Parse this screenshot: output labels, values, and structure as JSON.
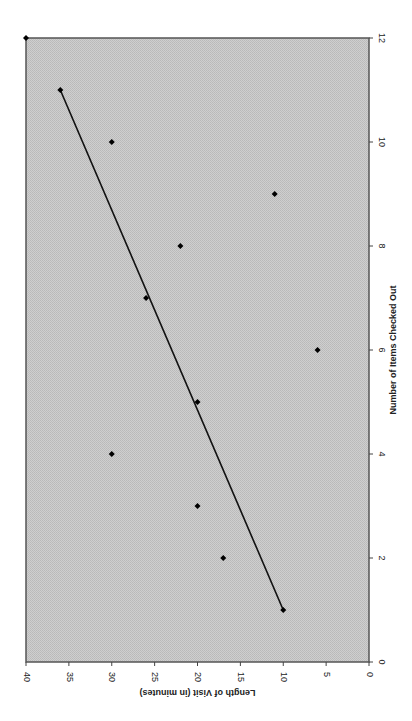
{
  "colors": {
    "plot_background": "#c8c8c8",
    "plot_border": "#555555",
    "marker": "#000000",
    "trendline": "#111111",
    "page_background": "#ffffff"
  },
  "layout": {
    "rotation_deg": -90,
    "plot_left_px": 26,
    "plot_right_px": 369,
    "plot_top_px": 38,
    "plot_bottom_px": 662
  },
  "chart_data": {
    "type": "scatter",
    "title": "",
    "xlabel": "Number of Items Checked Out",
    "ylabel": "Length of Visit (in minutes)",
    "xlim": [
      0,
      12
    ],
    "ylim": [
      0,
      40
    ],
    "x_ticks": [
      "0",
      "2",
      "4",
      "6",
      "8",
      "10",
      "12"
    ],
    "y_ticks": [
      "0",
      "5",
      "10",
      "15",
      "20",
      "25",
      "30",
      "35",
      "40"
    ],
    "grid": false,
    "legend": null,
    "series": [
      {
        "name": "Visits",
        "type": "scatter",
        "x": [
          1,
          2,
          3,
          4,
          5,
          6,
          7,
          8,
          9,
          10,
          11
        ],
        "y": [
          10,
          17,
          20,
          30,
          20,
          6,
          26,
          22,
          11,
          30,
          36
        ]
      },
      {
        "name": "Trend line",
        "type": "line",
        "x": [
          1,
          11
        ],
        "y": [
          10,
          36
        ]
      },
      {
        "name": "Corner marker",
        "type": "scatter",
        "x": [
          12
        ],
        "y": [
          40
        ]
      }
    ]
  }
}
